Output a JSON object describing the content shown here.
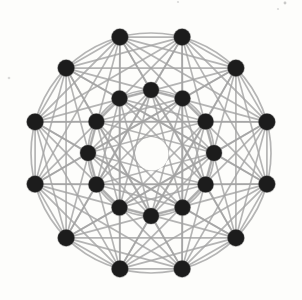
{
  "figure": {
    "type": "network-graph",
    "canvas": {
      "width": 302,
      "height": 300,
      "background": "#fdfdfb"
    },
    "center": {
      "x": 151,
      "y": 153
    },
    "node_color": "#1b1b1b",
    "node_edge_color": "#555555",
    "edge_style": {
      "color": "#a3a3a3",
      "width": 1.7,
      "opacity": 0.8
    },
    "rings": {
      "outer": {
        "count": 12,
        "radius": 120,
        "angle_offset_deg": 15,
        "node_radius": 8.4,
        "circle_drawn": true
      },
      "inner": {
        "count": 12,
        "radius": 63,
        "angle_offset_deg": 0,
        "node_radius": 8.0,
        "circle_drawn": true
      }
    },
    "chord_steps": {
      "outer": [
        1,
        2,
        3,
        4,
        5
      ],
      "inner": [
        1,
        3,
        4,
        5
      ]
    },
    "spokes": "each outer node connects to its two nearest inner nodes",
    "hub": {
      "x": 152,
      "y": 154,
      "radius": 16.5,
      "fill": "#fdfdfb"
    },
    "specks": [
      {
        "x": 285,
        "y": 3,
        "r": 1.4,
        "opacity": 0.45
      },
      {
        "x": 278,
        "y": 9,
        "r": 1.1,
        "opacity": 0.3
      },
      {
        "x": 178,
        "y": 2,
        "r": 1.1,
        "opacity": 0.3
      },
      {
        "x": 9,
        "y": 78,
        "r": 1.3,
        "opacity": 0.3
      },
      {
        "x": 57,
        "y": 146,
        "r": 1.1,
        "opacity": 0.35
      }
    ]
  }
}
